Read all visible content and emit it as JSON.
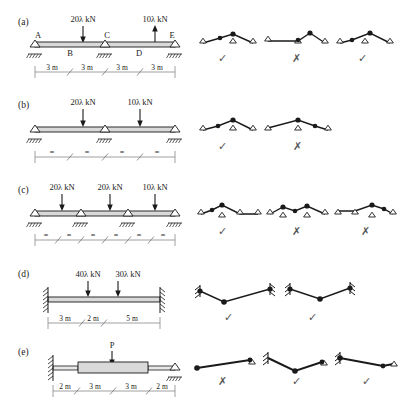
{
  "figure": {
    "type": "engineering-diagram",
    "width": 403,
    "height": 408,
    "ink_color": "#1a1a1a",
    "beam_fill": "#d9d9d9",
    "mark_color": "#555555"
  },
  "rows": [
    {
      "id": "a",
      "label": "(a)",
      "beam": {
        "description": "Continuous beam A-E on three supports, roller at A, roller at C, roller at E",
        "node_labels": [
          "A",
          "B",
          "C",
          "D",
          "E"
        ],
        "supports": [
          "pin-hatched",
          "pin-hatched",
          "pin-hatched"
        ],
        "loads": [
          {
            "label": "20λ kN",
            "direction": "down"
          },
          {
            "label": "10λ kN",
            "direction": "up"
          }
        ],
        "dimensions": [
          "3 m",
          "3 m",
          "3 m",
          "3 m"
        ]
      },
      "answers": [
        {
          "mark": "✓",
          "mark_name": "check"
        },
        {
          "mark": "✗",
          "mark_name": "cross"
        },
        {
          "mark": "✓",
          "mark_name": "check"
        }
      ]
    },
    {
      "id": "b",
      "label": "(b)",
      "beam": {
        "description": "Continuous beam on three supports with four equal spans",
        "node_labels": [],
        "supports": [
          "pin-hatched",
          "pin-hatched",
          "pin-hatched"
        ],
        "loads": [
          {
            "label": "20λ kN",
            "direction": "down"
          },
          {
            "label": "10λ kN",
            "direction": "down"
          }
        ],
        "dimensions": [
          "=",
          "=",
          "=",
          "="
        ]
      },
      "answers": [
        {
          "mark": "✓",
          "mark_name": "check"
        },
        {
          "mark": "✗",
          "mark_name": "cross"
        }
      ]
    },
    {
      "id": "c",
      "label": "(c)",
      "beam": {
        "description": "Continuous beam on four supports with six equal spans",
        "node_labels": [],
        "supports": [
          "pin-hatched",
          "pin-hatched",
          "pin-hatched",
          "pin-hatched"
        ],
        "loads": [
          {
            "label": "20λ kN",
            "direction": "down"
          },
          {
            "label": "20λ kN",
            "direction": "down"
          },
          {
            "label": "10λ kN",
            "direction": "down"
          }
        ],
        "dimensions": [
          "=",
          "=",
          "=",
          "=",
          "=",
          "="
        ]
      },
      "answers": [
        {
          "mark": "✓",
          "mark_name": "check"
        },
        {
          "mark": "✗",
          "mark_name": "cross"
        },
        {
          "mark": "✗",
          "mark_name": "cross"
        }
      ]
    },
    {
      "id": "d",
      "label": "(d)",
      "beam": {
        "description": "Fixed-fixed beam with two point loads",
        "node_labels": [],
        "supports": [
          "fixed-wall",
          "fixed-wall"
        ],
        "loads": [
          {
            "label": "40λ kN",
            "direction": "down"
          },
          {
            "label": "30λ kN",
            "direction": "down"
          }
        ],
        "dimensions": [
          "3 m",
          "2 m",
          "5 m"
        ]
      },
      "answers": [
        {
          "mark": "✓",
          "mark_name": "check"
        },
        {
          "mark": "✓",
          "mark_name": "check"
        }
      ]
    },
    {
      "id": "e",
      "label": "(e)",
      "beam": {
        "description": "Fixed-pinned beam with haunched (thicker) middle section and central load P",
        "node_labels": [],
        "supports": [
          "fixed-wall",
          "pin-hatched"
        ],
        "loads": [
          {
            "label": "P",
            "direction": "down"
          }
        ],
        "dimensions": [
          "2 m",
          "3 m",
          "3 m",
          "2 m"
        ]
      },
      "answers": [
        {
          "mark": "✗",
          "mark_name": "cross"
        },
        {
          "mark": "✓",
          "mark_name": "check"
        },
        {
          "mark": "✓",
          "mark_name": "check"
        }
      ]
    }
  ]
}
